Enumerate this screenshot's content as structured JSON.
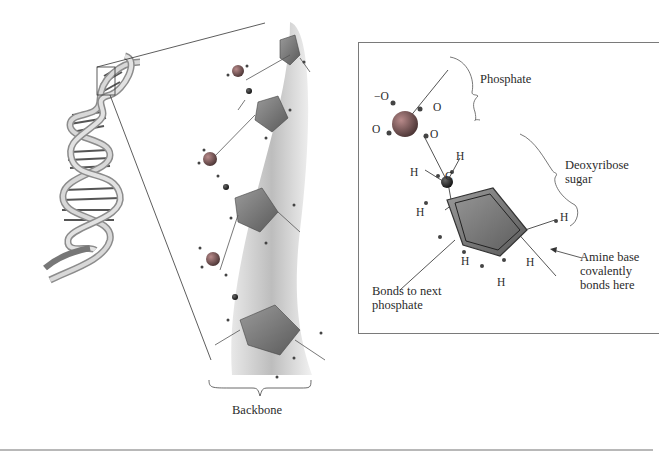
{
  "figure": {
    "type": "DNA structure diagram",
    "helix": {
      "description": "Double helix with zoom box on upper turn"
    },
    "backbone_label": "Backbone",
    "inset": {
      "labels": {
        "phosphate": "Phosphate",
        "deoxyribose_line1": "Deoxyribose",
        "deoxyribose_line2": "sugar",
        "amine_line1": "Amine base",
        "amine_line2": "covalently",
        "amine_line3": "bonds here",
        "bonds_line1": "Bonds to next",
        "bonds_line2": "phosphate"
      },
      "atoms": {
        "o_minus": "−O",
        "o_top_right": "O",
        "o_left": "O",
        "o_lower_right": "O",
        "p": "P",
        "h_upper": "H",
        "h_left": "H",
        "c": "C",
        "ring_h_left": "H",
        "ring_h_right": "H",
        "ring_h_bottom1": "H",
        "ring_h_bottom2": "H",
        "ring_h_bottom3": "H",
        "ring_o": "O"
      }
    },
    "colors": {
      "ribbon": "#c9c9c9",
      "sugar": "#7e7e7e",
      "phosphate": "#8a5a5a",
      "line": "#555555"
    }
  }
}
